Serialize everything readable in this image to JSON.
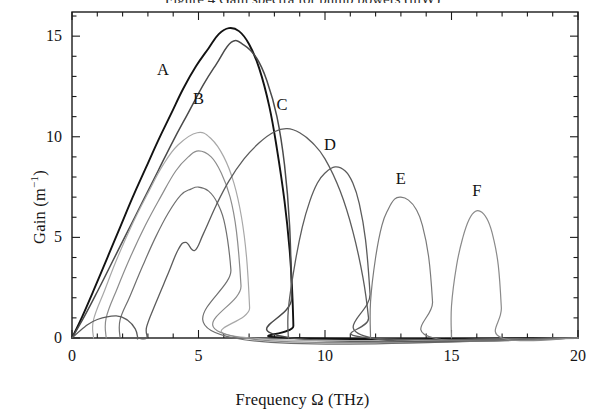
{
  "figure": {
    "clipped_caption_top": "Figure 4 Gain spectra for pump powers (mW)",
    "background_color": "#ffffff",
    "frame_color": "#1b1b1b"
  },
  "axes": {
    "x": {
      "label_text": "Frequency Ω (THz)",
      "min": 0,
      "max": 20,
      "major_ticks": [
        0,
        5,
        10,
        15,
        20
      ],
      "major_tick_labels": [
        "0",
        "5",
        "10",
        "15",
        "20"
      ],
      "minor_tick_step": 1
    },
    "y": {
      "label_html": "Gain (m<sup>−1</sup>)",
      "label_text": "Gain (m-1)",
      "min": 0,
      "max": 16.2,
      "major_ticks": [
        0,
        5,
        10,
        15
      ],
      "major_tick_labels": [
        "0",
        "5",
        "10",
        "15"
      ],
      "minor_tick_step": 1
    }
  },
  "curve_labels": [
    {
      "text": "A",
      "x": 3.6,
      "y": 13.3
    },
    {
      "text": "B",
      "x": 5.0,
      "y": 11.9
    },
    {
      "text": "C",
      "x": 8.3,
      "y": 11.6
    },
    {
      "text": "D",
      "x": 10.2,
      "y": 9.6
    },
    {
      "text": "E",
      "x": 13.0,
      "y": 7.9
    },
    {
      "text": "F",
      "x": 16.0,
      "y": 7.3
    }
  ],
  "chart_data": {
    "type": "line",
    "title": "",
    "xlabel": "Frequency Ω (THz)",
    "ylabel": "Gain (m⁻¹)",
    "xlim": [
      0,
      20
    ],
    "ylim": [
      0,
      16.2
    ],
    "grid": false,
    "legend": "inline-labels",
    "series": [
      {
        "name": "A",
        "color": "#121212",
        "width": 1.9,
        "peak_x": 6.2,
        "peak_y": 15.4,
        "cutoff_x": 8.75,
        "shape": "single-lobe-sharp-cutoff",
        "x": [
          0.0,
          0.4,
          0.9,
          1.4,
          1.9,
          2.4,
          2.9,
          3.4,
          3.9,
          4.4,
          4.9,
          5.4,
          5.8,
          6.2,
          6.6,
          7.0,
          7.4,
          7.8,
          8.1,
          8.4,
          8.6,
          8.7,
          8.75,
          8.75,
          20.0
        ],
        "y": [
          0.0,
          1.05,
          2.5,
          4.0,
          5.5,
          7.0,
          8.4,
          9.8,
          11.1,
          12.4,
          13.5,
          14.4,
          15.1,
          15.4,
          15.25,
          14.6,
          13.4,
          11.5,
          9.4,
          6.8,
          4.4,
          2.4,
          0.6,
          0.0,
          0.0
        ]
      },
      {
        "name": "B",
        "color": "#4a4a4a",
        "width": 1.5,
        "peak_x": 6.3,
        "peak_y": 14.7,
        "cutoff_x": 8.7,
        "shape": "single-lobe-sharp-cutoff",
        "x": [
          0.0,
          0.5,
          1.0,
          1.6,
          2.2,
          2.8,
          3.4,
          4.0,
          4.6,
          5.2,
          5.7,
          6.3,
          6.8,
          7.3,
          7.7,
          8.1,
          8.4,
          8.6,
          8.68,
          8.7,
          20.0
        ],
        "y": [
          0.0,
          1.1,
          2.3,
          3.8,
          5.3,
          6.8,
          8.3,
          9.8,
          11.2,
          12.6,
          13.6,
          14.7,
          14.55,
          13.9,
          12.8,
          11.0,
          8.6,
          5.6,
          2.0,
          0.0,
          0.0
        ]
      },
      {
        "name": "third-lobe-light",
        "color": "#a8a8a8",
        "width": 1.2,
        "peak_x": 4.95,
        "peak_y": 10.2,
        "cutoff_x": 7.05,
        "start_x": 0.85,
        "shape": "lobe",
        "x": [
          0.85,
          0.85,
          1.3,
          1.8,
          2.4,
          3.0,
          3.6,
          4.2,
          4.95,
          5.5,
          6.0,
          6.4,
          6.7,
          6.9,
          7.02,
          7.05,
          20.0
        ],
        "y": [
          0.0,
          0.9,
          2.4,
          4.0,
          5.7,
          7.2,
          8.6,
          9.6,
          10.2,
          9.9,
          9.0,
          7.7,
          6.0,
          4.0,
          1.5,
          0.0,
          0.0
        ]
      },
      {
        "name": "fourth-lobe-mid",
        "color": "#8c8c8c",
        "width": 1.2,
        "peak_x": 5.0,
        "peak_y": 9.3,
        "cutoff_x": 6.75,
        "start_x": 1.35,
        "shape": "lobe",
        "x": [
          1.35,
          1.35,
          1.8,
          2.3,
          2.9,
          3.5,
          4.1,
          4.6,
          5.0,
          5.5,
          5.9,
          6.25,
          6.5,
          6.68,
          6.75,
          20.0
        ],
        "y": [
          0.0,
          1.0,
          2.5,
          4.0,
          5.6,
          7.0,
          8.3,
          9.0,
          9.3,
          9.0,
          8.2,
          7.0,
          5.3,
          2.6,
          0.0,
          0.0
        ]
      },
      {
        "name": "fifth-lobe-gray",
        "color": "#6f6f6f",
        "width": 1.2,
        "peak_x": 5.0,
        "peak_y": 7.5,
        "cutoff_x": 6.4,
        "start_x": 1.9,
        "shape": "lobe",
        "x": [
          1.9,
          1.9,
          2.3,
          2.8,
          3.3,
          3.8,
          4.3,
          4.7,
          5.0,
          5.4,
          5.75,
          6.05,
          6.28,
          6.4,
          20.0
        ],
        "y": [
          0.0,
          0.9,
          2.1,
          3.6,
          5.0,
          6.2,
          7.1,
          7.4,
          7.5,
          7.3,
          6.7,
          5.6,
          3.4,
          0.0,
          0.0
        ]
      },
      {
        "name": "C",
        "color": "#5c5c5c",
        "width": 1.3,
        "peak_x": 8.5,
        "peak_y": 10.4,
        "lobes": 2,
        "first_lobe": {
          "start_x": 0.0,
          "peak_x": 1.75,
          "peak_y": 1.1,
          "end_x": 2.6
        },
        "second_lobe": {
          "start_x": 2.95,
          "peak_x": 8.5,
          "peak_y": 10.4,
          "end_x": 11.75
        },
        "shoulder": {
          "x": 4.5,
          "y": 4.75,
          "dip_x": 4.85,
          "dip_y": 4.35
        },
        "x": [
          0.0,
          0.5,
          1.0,
          1.75,
          2.2,
          2.5,
          2.6,
          2.6,
          2.95,
          2.95,
          3.3,
          3.8,
          4.2,
          4.5,
          4.85,
          5.2,
          5.7,
          6.2,
          6.8,
          7.4,
          8.0,
          8.5,
          9.0,
          9.5,
          10.0,
          10.6,
          11.1,
          11.5,
          11.72,
          11.75,
          20.0
        ],
        "y": [
          0.0,
          0.55,
          0.92,
          1.1,
          0.88,
          0.45,
          0.0,
          0.0,
          0.0,
          0.55,
          1.7,
          3.2,
          4.4,
          4.75,
          4.35,
          5.2,
          6.6,
          7.8,
          8.9,
          9.7,
          10.25,
          10.4,
          10.2,
          9.7,
          8.9,
          7.3,
          5.3,
          3.0,
          1.0,
          0.0,
          0.0
        ]
      },
      {
        "name": "D",
        "color": "#5c5c5c",
        "width": 1.3,
        "peak_x": 10.4,
        "peak_y": 8.5,
        "start_x": 8.55,
        "end_x": 11.85,
        "shape": "lobe",
        "x": [
          8.55,
          8.55,
          8.8,
          9.1,
          9.4,
          9.7,
          10.0,
          10.4,
          10.8,
          11.1,
          11.35,
          11.6,
          11.78,
          11.85,
          20.0
        ],
        "y": [
          0.0,
          1.4,
          3.6,
          5.5,
          6.8,
          7.7,
          8.2,
          8.5,
          8.3,
          7.7,
          6.7,
          4.9,
          2.2,
          0.0,
          0.0
        ]
      },
      {
        "name": "E",
        "color": "#7a7a7a",
        "width": 1.2,
        "peak_x": 13.0,
        "peak_y": 7.0,
        "start_x": 11.8,
        "end_x": 14.3,
        "shape": "lobe",
        "x": [
          11.8,
          11.8,
          12.0,
          12.25,
          12.5,
          12.75,
          13.0,
          13.3,
          13.6,
          13.85,
          14.1,
          14.25,
          14.3,
          20.0
        ],
        "y": [
          0.0,
          1.8,
          4.0,
          5.6,
          6.4,
          6.9,
          7.0,
          6.85,
          6.4,
          5.6,
          4.0,
          1.8,
          0.0,
          0.0
        ]
      },
      {
        "name": "F",
        "color": "#8a8a8a",
        "width": 1.2,
        "peak_x": 16.0,
        "peak_y": 6.3,
        "start_x": 15.0,
        "end_x": 17.0,
        "shape": "lobe",
        "x": [
          15.0,
          15.0,
          15.2,
          15.45,
          15.7,
          15.95,
          16.2,
          16.45,
          16.65,
          16.85,
          16.97,
          17.0,
          20.0
        ],
        "y": [
          0.0,
          1.6,
          3.6,
          5.0,
          5.9,
          6.3,
          6.25,
          5.8,
          5.0,
          3.6,
          1.5,
          0.0,
          0.0
        ]
      }
    ]
  }
}
